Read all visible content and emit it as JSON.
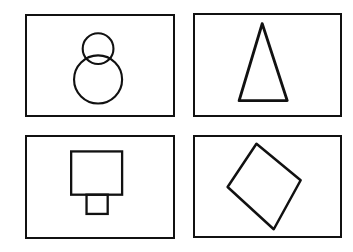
{
  "figure": {
    "panels": [
      {
        "id": "top-left",
        "shape": "figure-eight (two stacked circles)",
        "label": ""
      },
      {
        "id": "top-right",
        "shape": "tall narrow triangle",
        "label": ""
      },
      {
        "id": "bottom-left",
        "shape": "square with small rectangle below",
        "label": ""
      },
      {
        "id": "bottom-right",
        "shape": "diamond (rotated square)",
        "label": ""
      }
    ],
    "stroke_color": "#111111",
    "background_color": "#ffffff"
  }
}
